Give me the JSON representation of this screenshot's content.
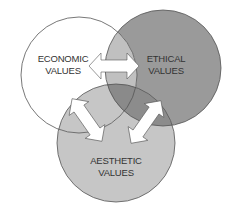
{
  "diagram": {
    "type": "venn",
    "sets": [
      {
        "id": "economic",
        "line1": "ECONOMIC",
        "line2": "VALUES",
        "fill": "#ffffff"
      },
      {
        "id": "ethical",
        "line1": "ETHICAL",
        "line2": "VALUES",
        "fill": "#9a9a9a"
      },
      {
        "id": "aesthetic",
        "line1": "AESTHETIC",
        "line2": "VALUES",
        "fill": "#c6c6c6"
      }
    ],
    "arrows": [
      {
        "from": "economic",
        "to": "ethical",
        "style": "double-headed"
      },
      {
        "from": "economic",
        "to": "aesthetic",
        "style": "double-headed"
      },
      {
        "from": "ethical",
        "to": "aesthetic",
        "style": "double-headed"
      }
    ],
    "colors": {
      "outline": "#555555",
      "overlap_econ_eth": "#c0c0c0",
      "overlap_eth_aes": "#8c8c8c",
      "overlap_all": "#8a8a8a",
      "arrow_fill": "#ffffff"
    }
  }
}
